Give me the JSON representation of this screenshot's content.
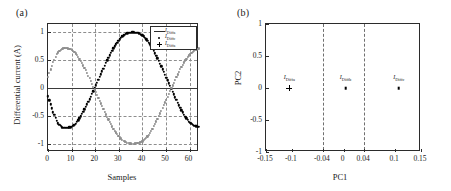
{
  "figure": {
    "panel_a_tag": "(a)",
    "panel_b_tag": "(b)"
  },
  "series_labels": {
    "a_main": "I",
    "a_sub": "Diffa",
    "b_main": "I",
    "b_sub": "Diffb",
    "c_main": "I",
    "c_sub": "Diffc"
  },
  "legend": {
    "items": [
      {
        "marker": "line-marker",
        "main": "I",
        "sub": "Diffa"
      },
      {
        "marker": "dot-marker",
        "main": "I",
        "sub": "Diffc"
      },
      {
        "marker": "plus-marker",
        "main": "I",
        "sub": "Diffa"
      }
    ]
  },
  "chart_data": [
    {
      "type": "line",
      "panel": "(a)",
      "title": "",
      "xlabel": "Samples",
      "ylabel": "Differential current (A)",
      "xlim": [
        0,
        64
      ],
      "ylim": [
        -1.15,
        1.15
      ],
      "xticks": [
        0,
        10,
        20,
        30,
        40,
        50,
        60
      ],
      "xticklabels": [
        "0",
        "10",
        "20",
        "30",
        "40",
        "50",
        "60"
      ],
      "yticks": [
        -1,
        -0.5,
        0,
        0.5,
        1
      ],
      "yticklabels": [
        "-1",
        "-0.5",
        "0",
        "0.5",
        "1"
      ],
      "grid": true,
      "legend_position": "upper right",
      "series": [
        {
          "name": "I_Diffa",
          "marker": "line",
          "color": "#3a3a3a",
          "description": "flat trace at zero amplitude",
          "x": [
            0,
            64
          ],
          "values": [
            0,
            0
          ]
        },
        {
          "name": "I_Diffc",
          "marker": "square-dot",
          "color": "#000000",
          "description": "sinusoid rising from -0.15, trough -0.72 near sample 9, peak 1.0 near sample 39",
          "x": [
            0,
            2,
            4,
            6,
            8,
            10,
            12,
            14,
            16,
            18,
            20,
            22,
            24,
            26,
            28,
            30,
            32,
            34,
            36,
            38,
            40,
            42,
            44,
            46,
            48,
            50,
            52,
            54,
            56,
            58,
            60,
            62,
            64
          ],
          "values": [
            -0.15,
            -0.42,
            -0.62,
            -0.71,
            -0.72,
            -0.7,
            -0.63,
            -0.5,
            -0.34,
            -0.17,
            0.02,
            0.21,
            0.4,
            0.58,
            0.73,
            0.86,
            0.95,
            0.99,
            1.0,
            0.99,
            0.95,
            0.86,
            0.73,
            0.57,
            0.39,
            0.2,
            0.01,
            -0.18,
            -0.36,
            -0.51,
            -0.62,
            -0.68,
            -0.7
          ]
        },
        {
          "name": "I_Diffb",
          "marker": "square-dot",
          "color": "#8e8e8e",
          "description": "sinusoid from 0.20, peak 0.72 near sample 9, trough -1.0 near sample 40",
          "x": [
            0,
            2,
            4,
            6,
            8,
            10,
            12,
            14,
            16,
            18,
            20,
            22,
            24,
            26,
            28,
            30,
            32,
            34,
            36,
            38,
            40,
            42,
            44,
            46,
            48,
            50,
            52,
            54,
            56,
            58,
            60,
            62,
            64
          ],
          "values": [
            0.2,
            0.45,
            0.63,
            0.71,
            0.72,
            0.69,
            0.61,
            0.48,
            0.32,
            0.14,
            -0.05,
            -0.24,
            -0.43,
            -0.6,
            -0.75,
            -0.87,
            -0.95,
            -0.99,
            -1.0,
            -0.99,
            -0.96,
            -0.88,
            -0.75,
            -0.59,
            -0.41,
            -0.22,
            -0.03,
            0.16,
            0.34,
            0.49,
            0.6,
            0.68,
            0.71
          ]
        }
      ]
    },
    {
      "type": "scatter",
      "panel": "(b)",
      "title": "",
      "xlabel": "PC1",
      "ylabel": "PC2",
      "xlim": [
        -0.15,
        0.15
      ],
      "ylim": [
        -1,
        1
      ],
      "xticks": [
        -0.15,
        -0.1,
        -0.04,
        0,
        0.04,
        0.1,
        0.15
      ],
      "xticklabels": [
        "-0.15",
        "-0.1",
        "-0.04",
        "0",
        "0.04",
        "0.1",
        "0.15"
      ],
      "yticks": [
        -1,
        -0.5,
        0,
        0.5,
        1
      ],
      "yticklabels": [
        "-1",
        "-0.5",
        "0",
        "0.5",
        "1"
      ],
      "grid": false,
      "vlines": [
        -0.04,
        0.04
      ],
      "points": [
        {
          "label_main": "I",
          "label_sub": "Diffa",
          "x": -0.105,
          "y": 0,
          "marker": "plus"
        },
        {
          "label_main": "I",
          "label_sub": "Diffb",
          "x": 0.004,
          "y": 0,
          "marker": "square"
        },
        {
          "label_main": "I",
          "label_sub": "Diffc",
          "x": 0.107,
          "y": 0,
          "marker": "square"
        }
      ]
    }
  ]
}
